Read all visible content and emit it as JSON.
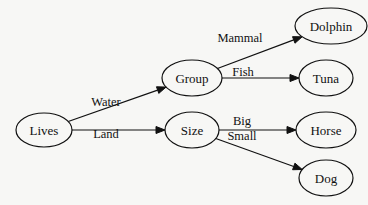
{
  "diagram": {
    "type": "directed-tree",
    "nodes": [
      {
        "id": "lives",
        "label": "Lives",
        "cx": 44,
        "cy": 130,
        "rx": 28,
        "ry": 17
      },
      {
        "id": "group",
        "label": "Group",
        "cx": 192,
        "cy": 78,
        "rx": 30,
        "ry": 18
      },
      {
        "id": "size",
        "label": "Size",
        "cx": 192,
        "cy": 130,
        "rx": 27,
        "ry": 18
      },
      {
        "id": "dolphin",
        "label": "Dolphin",
        "cx": 331,
        "cy": 26,
        "rx": 36,
        "ry": 18
      },
      {
        "id": "tuna",
        "label": "Tuna",
        "cx": 326,
        "cy": 78,
        "rx": 27,
        "ry": 18
      },
      {
        "id": "horse",
        "label": "Horse",
        "cx": 326,
        "cy": 130,
        "rx": 30,
        "ry": 18
      },
      {
        "id": "dog",
        "label": "Dog",
        "cx": 326,
        "cy": 178,
        "rx": 27,
        "ry": 18
      }
    ],
    "edges": [
      {
        "from": "lives",
        "to": "group",
        "label": "Water",
        "lx": 106,
        "ly": 106
      },
      {
        "from": "lives",
        "to": "size",
        "label": "Land",
        "lx": 106,
        "ly": 138
      },
      {
        "from": "group",
        "to": "dolphin",
        "label": "Mammal",
        "lx": 240,
        "ly": 42
      },
      {
        "from": "group",
        "to": "tuna",
        "label": "Fish",
        "lx": 243,
        "ly": 76
      },
      {
        "from": "size",
        "to": "horse",
        "label": "Big",
        "lx": 242,
        "ly": 125
      },
      {
        "from": "size",
        "to": "dog",
        "label": "Small",
        "lx": 242,
        "ly": 140
      }
    ]
  }
}
